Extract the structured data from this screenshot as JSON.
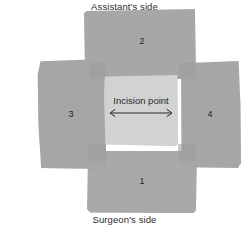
{
  "figure": {
    "background_color": "#ffffff",
    "drape_color": "#a8a8a8",
    "field_color": "#d2d2d2",
    "text_color": "#2b2b2b"
  },
  "labels": {
    "assistant_side": "Assistant's side",
    "surgeon_side": "Surgeon's side",
    "incision_point": "Incision point"
  },
  "drapes": [
    {
      "number": "1",
      "position": "bottom"
    },
    {
      "number": "2",
      "position": "top"
    },
    {
      "number": "3",
      "position": "left"
    },
    {
      "number": "4",
      "position": "right"
    }
  ],
  "arrow": {
    "name": "double-headed-arrow",
    "orientation": "horizontal",
    "heads": "both"
  }
}
